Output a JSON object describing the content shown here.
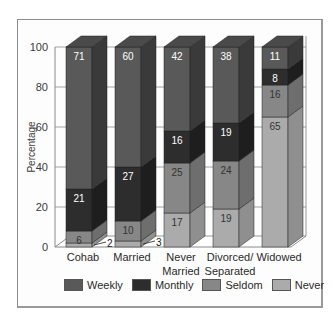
{
  "chart_data": {
    "type": "bar",
    "stacked": true,
    "three_d": true,
    "title": "",
    "xlabel": "",
    "ylabel": "Percentage",
    "ylim": [
      0,
      100
    ],
    "yticks": [
      0,
      20,
      40,
      60,
      80,
      100
    ],
    "categories": [
      "Cohab",
      "Married",
      "Never Married",
      "Divorced/ Separated",
      "Widowed"
    ],
    "category_lines": [
      [
        "Cohab"
      ],
      [
        "Married"
      ],
      [
        "Never",
        "Married"
      ],
      [
        "Divorced/",
        "Separated"
      ],
      [
        "Widowed"
      ]
    ],
    "series": [
      {
        "name": "Never",
        "values": [
          2,
          3,
          17,
          19,
          65
        ],
        "color": "#ababab",
        "side": "#8f8f8f",
        "top": "#c2c2c2",
        "label_color": "#333333"
      },
      {
        "name": "Seldom",
        "values": [
          6,
          10,
          25,
          24,
          16
        ],
        "color": "#878787",
        "side": "#6e6e6e",
        "top": "#9c9c9c",
        "label_color": "#333333"
      },
      {
        "name": "Monthly",
        "values": [
          21,
          27,
          16,
          19,
          8
        ],
        "color": "#2d2d2d",
        "side": "#1e1e1e",
        "top": "#3c3c3c",
        "label_color": "#ffffff"
      },
      {
        "name": "Weekly",
        "values": [
          71,
          60,
          42,
          38,
          11
        ],
        "color": "#595959",
        "side": "#3a3a3a",
        "top": "#4a4a4a",
        "label_color": "#ffffff"
      }
    ],
    "legend": [
      "Weekly",
      "Monthly",
      "Seldom",
      "Never"
    ],
    "legend_position": "bottom",
    "grid": true,
    "outside_labels": [
      {
        "category": "Cohab",
        "series": "Never",
        "value": 2
      },
      {
        "category": "Married",
        "series": "Never",
        "value": 3
      }
    ]
  },
  "legend_items": [
    {
      "label": "Weekly",
      "color": "#595959"
    },
    {
      "label": "Monthly",
      "color": "#2d2d2d"
    },
    {
      "label": "Seldom",
      "color": "#878787"
    },
    {
      "label": "Never",
      "color": "#ababab"
    }
  ]
}
